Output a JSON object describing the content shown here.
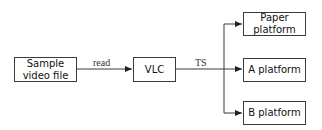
{
  "diagram": {
    "nodes": {
      "source": {
        "label": "Sample video file"
      },
      "vlc": {
        "label": "VLC"
      },
      "paper": {
        "label": "Paper platform"
      },
      "a": {
        "label": "A platform"
      },
      "b": {
        "label": "B platform"
      }
    },
    "edges": {
      "read": {
        "label": "read",
        "from": "Sample video file",
        "to": "VLC"
      },
      "ts": {
        "label": "TS",
        "from": "VLC",
        "to": [
          "Paper platform",
          "A platform",
          "B platform"
        ]
      }
    },
    "colors": {
      "line": "#3a3a3a",
      "box_border": "#3a3a3a",
      "text": "#111111"
    }
  }
}
